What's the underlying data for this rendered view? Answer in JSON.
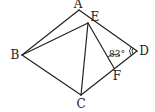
{
  "diagram": {
    "points": {
      "A": {
        "label": "A",
        "x": 79,
        "y": 10,
        "lx": 78,
        "ly": 4
      },
      "B": {
        "label": "B",
        "x": 22,
        "y": 55,
        "lx": 15,
        "ly": 55
      },
      "C": {
        "label": "C",
        "x": 81,
        "y": 95,
        "lx": 81,
        "ly": 104
      },
      "D": {
        "label": "D",
        "x": 137,
        "y": 51,
        "lx": 144,
        "ly": 51
      },
      "E": {
        "label": "E",
        "x": 88,
        "y": 23,
        "lx": 95,
        "ly": 17
      },
      "F": {
        "label": "F",
        "x": 114,
        "y": 68,
        "lx": 117,
        "ly": 76
      }
    },
    "segments": [
      [
        "A",
        "B"
      ],
      [
        "B",
        "C"
      ],
      [
        "C",
        "D"
      ],
      [
        "D",
        "A"
      ],
      [
        "B",
        "E"
      ],
      [
        "E",
        "C"
      ],
      [
        "E",
        "F"
      ]
    ],
    "angle_label": {
      "text": "83°",
      "x": 117,
      "y": 54
    }
  }
}
